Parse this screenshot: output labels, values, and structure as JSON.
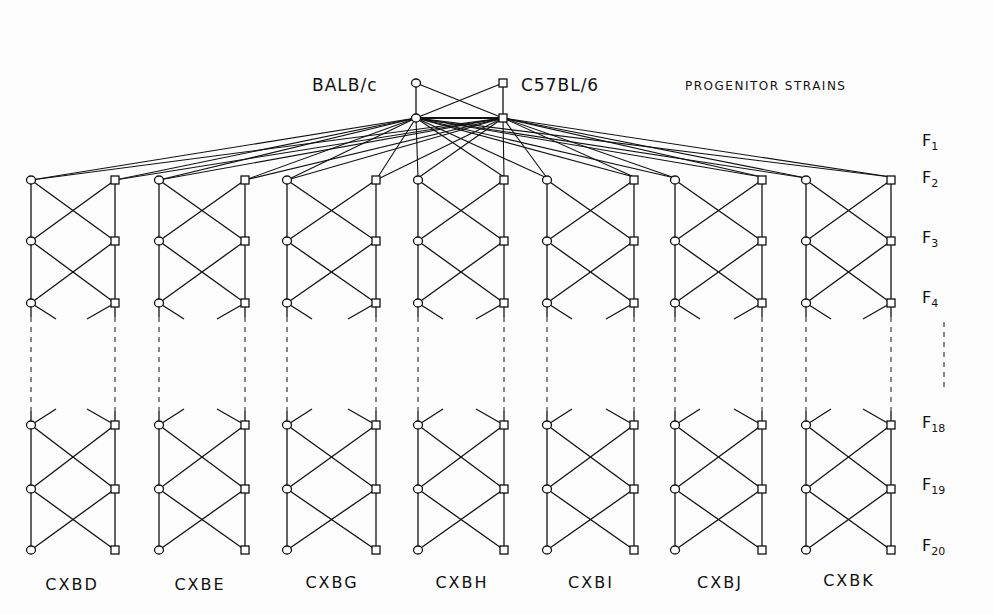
{
  "progenitors": {
    "left": {
      "label": "BALB/c",
      "shape": "circle"
    },
    "right": {
      "label": "C57BL/6",
      "shape": "square"
    },
    "title": "PROGENITOR STRAINS"
  },
  "generations": [
    {
      "base": "F",
      "sub": "1"
    },
    {
      "base": "F",
      "sub": "2"
    },
    {
      "base": "F",
      "sub": "3"
    },
    {
      "base": "F",
      "sub": "4"
    },
    {
      "base": "F",
      "sub": "18"
    },
    {
      "base": "F",
      "sub": "19"
    },
    {
      "base": "F",
      "sub": "20"
    }
  ],
  "strains": [
    {
      "label": "CXBD",
      "x_left": 31,
      "x_right": 115
    },
    {
      "label": "CXBE",
      "x_left": 159,
      "x_right": 245
    },
    {
      "label": "CXBG",
      "x_left": 287,
      "x_right": 376
    },
    {
      "label": "CXBH",
      "x_left": 418,
      "x_right": 504
    },
    {
      "label": "CXBI",
      "x_left": 547,
      "x_right": 634
    },
    {
      "label": "CXBJ",
      "x_left": 675,
      "x_right": 762
    },
    {
      "label": "CXBK",
      "x_left": 806,
      "x_right": 891
    }
  ],
  "legend": {
    "circle": "female",
    "square": "male"
  }
}
